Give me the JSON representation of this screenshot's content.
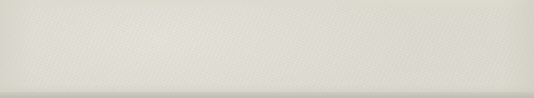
{
  "figure": {
    "background_color": "#dedbd0",
    "canvas": {
      "width": 534,
      "height": 98
    }
  },
  "style": {
    "circle_stroke": "#55524f",
    "polygon_stroke": "#1d2f52",
    "polygon_fill": "#b4d7ee",
    "radius_stroke": "#3a3f74",
    "axis_stroke": "#b05c52",
    "center_dot": "#b0246b",
    "vertex_dot": "#1a2540",
    "circle_stroke_width": 0.9,
    "polygon_stroke_width": 1.3,
    "radius_stroke_width": 0.8,
    "axis_stroke_width": 0.9
  },
  "chart_data": {
    "type": "diagram",
    "figures": [
      {
        "name": "triangle",
        "label": "equilateral triangle",
        "sides": 3,
        "center": {
          "x": 70,
          "y": 49
        },
        "circumradius": 34,
        "rotation_deg": -90,
        "vertex_angles_deg": [
          -90,
          30,
          150
        ],
        "interior_angle_deg": 60,
        "central_angle_deg": 120,
        "axis_count": 3,
        "show_radii": true,
        "show_axes": true,
        "axis_overshoot": 10
      },
      {
        "name": "square",
        "label": "square",
        "sides": 4,
        "center": {
          "x": 200,
          "y": 49
        },
        "circumradius": 34,
        "rotation_deg": -135,
        "vertex_angles_deg": [
          -135,
          -45,
          45,
          135
        ],
        "interior_angle_deg": 90,
        "central_angle_deg": 90,
        "axis_count": 4,
        "show_radii": true,
        "show_axes": true,
        "axis_overshoot": 12
      },
      {
        "name": "pentagon",
        "label": "regular pentagon",
        "sides": 5,
        "center": {
          "x": 333,
          "y": 49
        },
        "circumradius": 34,
        "rotation_deg": -90,
        "vertex_angles_deg": [
          -90,
          -18,
          54,
          126,
          198
        ],
        "interior_angle_deg": 108,
        "central_angle_deg": 72,
        "axis_count": 5,
        "show_radii": true,
        "show_axes": true,
        "axis_overshoot": 10
      },
      {
        "name": "hexagon",
        "label": "regular hexagon",
        "sides": 6,
        "center": {
          "x": 464,
          "y": 49
        },
        "circumradius": 34,
        "rotation_deg": -120,
        "vertex_angles_deg": [
          -120,
          -60,
          0,
          60,
          120,
          180
        ],
        "interior_angle_deg": 120,
        "central_angle_deg": 60,
        "axis_count": 6,
        "show_radii": true,
        "show_axes": true,
        "axis_overshoot": 10
      }
    ]
  }
}
